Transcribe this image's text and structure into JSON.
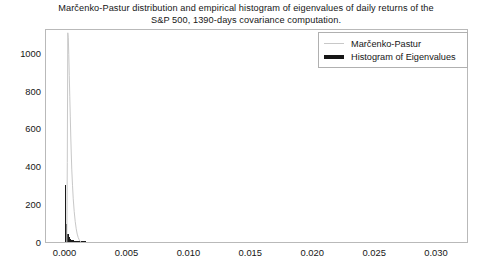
{
  "chart_data": {
    "type": "line",
    "title": "Marčenko-Pastur distribution and empirical histogram of eigenvalues of daily returns of the S&P 500, 1390-days covariance computation.",
    "title_lines": [
      "Marčenko-Pastur distribution and empirical histogram of eigenvalues of daily returns of the",
      "S&P 500, 1390-days covariance computation."
    ],
    "xlabel": "",
    "ylabel": "",
    "xlim": [
      -0.0015,
      0.0325
    ],
    "ylim": [
      0,
      1120
    ],
    "grid": false,
    "legend_position": "upper right",
    "x_ticks": [
      0.0,
      0.005,
      0.01,
      0.015,
      0.02,
      0.025,
      0.03
    ],
    "x_tick_labels": [
      "0.000",
      "0.005",
      "0.010",
      "0.015",
      "0.020",
      "0.025",
      "0.030"
    ],
    "y_ticks": [
      0,
      200,
      400,
      600,
      800,
      1000
    ],
    "y_tick_labels": [
      "0",
      "200",
      "400",
      "600",
      "800",
      "1000"
    ],
    "series": [
      {
        "name": "Marčenko-Pastur",
        "type": "line",
        "color": "#c8c8c8",
        "linewidth": 1,
        "x": [
          0.00018,
          0.00022,
          0.00026,
          0.0003,
          0.00034,
          0.00038,
          0.00042,
          0.00046,
          0.0005,
          0.00054,
          0.00058,
          0.00064,
          0.0007,
          0.00078,
          0.00086,
          0.00094,
          0.00102,
          0.0011,
          0.00118,
          0.00126,
          0.00134
        ],
        "values": [
          0,
          420,
          1105,
          1080,
          990,
          880,
          770,
          665,
          560,
          470,
          385,
          300,
          228,
          160,
          108,
          70,
          42,
          24,
          12,
          4,
          0
        ]
      },
      {
        "name": "Histogram of Eigenvalues",
        "type": "bar",
        "color": "#1b1b1b",
        "bin_edges": [
          0.0,
          0.00011,
          0.00022,
          0.00033,
          0.00044,
          0.00055,
          0.00066,
          0.00077,
          0.00088,
          0.00099,
          0.0011,
          0.00121,
          0.00132,
          0.00143,
          0.00154,
          0.00165,
          0.00176
        ],
        "values": [
          300,
          96,
          44,
          26,
          18,
          13,
          9,
          7,
          5,
          4,
          3,
          3,
          2,
          2,
          1,
          1
        ]
      }
    ]
  },
  "legend": {
    "entries": [
      {
        "label": "Marčenko-Pastur",
        "swatch": "thin-gray-line"
      },
      {
        "label": "Histogram of Eigenvalues",
        "swatch": "thick-black-line"
      }
    ]
  },
  "colors": {
    "marcenko_pastur": "#c8c8c8",
    "histogram": "#1b1b1b",
    "frame": "#b9b9b9",
    "text": "#161616",
    "background": "#ffffff"
  }
}
